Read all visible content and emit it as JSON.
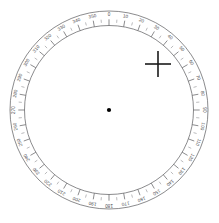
{
  "figure": {
    "kind": "circular-protractor-dial",
    "background_color": "#ffffff"
  },
  "dial": {
    "center_x": 109,
    "center_y": 110,
    "outer_radius": 99,
    "inner_radius": 84.5,
    "ring_stroke_color": "#59595c",
    "tick_color": "#5a5a5d",
    "label_color": "#4a4a4d",
    "zero_position": "top",
    "direction": "clockwise",
    "label_step_degrees": 10,
    "minor_tick_step_degrees": 5,
    "labels": [
      "0",
      "10",
      "20",
      "30",
      "40",
      "50",
      "60",
      "70",
      "80",
      "90",
      "100",
      "110",
      "120",
      "130",
      "140",
      "150",
      "160",
      "170",
      "180",
      "190",
      "200",
      "210",
      "220",
      "230",
      "240",
      "250",
      "260",
      "270",
      "280",
      "290",
      "300",
      "310",
      "320",
      "330",
      "340",
      "350"
    ],
    "label_values": [
      0,
      10,
      20,
      30,
      40,
      50,
      60,
      70,
      80,
      90,
      100,
      110,
      120,
      130,
      140,
      150,
      160,
      170,
      180,
      190,
      200,
      210,
      220,
      230,
      240,
      250,
      260,
      270,
      280,
      290,
      300,
      310,
      320,
      330,
      340,
      350
    ]
  },
  "center_marker": {
    "name": "center-dot",
    "x": 109,
    "y": 110,
    "radius": 2.1,
    "color": "#000000"
  },
  "crosshair_marker": {
    "name": "crosshair",
    "x": 158,
    "y": 64,
    "arm_length": 13,
    "color": "#1a1a1a",
    "bearing_degrees": 47
  }
}
